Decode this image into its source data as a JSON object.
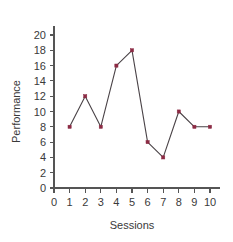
{
  "chart_data": {
    "type": "line",
    "title": "",
    "xlabel": "Sessions",
    "ylabel": "Performance",
    "x": [
      1,
      2,
      3,
      4,
      5,
      6,
      7,
      8,
      9,
      10
    ],
    "values": [
      8,
      12,
      8,
      16,
      18,
      6,
      4,
      10,
      8,
      8
    ],
    "series": [
      {
        "name": "Performance",
        "values": [
          8,
          12,
          8,
          16,
          18,
          6,
          4,
          10,
          8,
          8
        ]
      }
    ],
    "xlim": [
      0,
      10
    ],
    "ylim": [
      0,
      20
    ],
    "x_ticks": [
      "0",
      "1",
      "2",
      "3",
      "4",
      "5",
      "6",
      "7",
      "8",
      "9",
      "10"
    ],
    "y_ticks": [
      "0",
      "2",
      "4",
      "6",
      "8",
      "10",
      "12",
      "14",
      "16",
      "18",
      "20"
    ],
    "grid": false,
    "legend": false,
    "legend_position": "none",
    "marker": "square",
    "marker_color": "#8c2b44",
    "line_color": "#4a4347",
    "background_color": "#ffffff"
  }
}
